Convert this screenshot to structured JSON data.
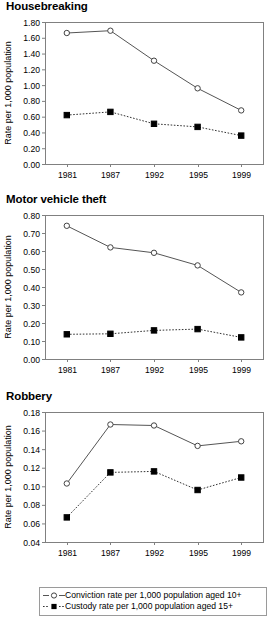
{
  "figure": {
    "y_axis_title": "Rate per 1,000 population",
    "x_categories": [
      "1981",
      "1987",
      "1992",
      "1995",
      "1999"
    ]
  },
  "legend": {
    "items": [
      {
        "label": "Conviction rate per 1,000 population aged 10+",
        "marker": "open-circle-marker",
        "line": "solid"
      },
      {
        "label": "Custody rate per 1,000 population aged 15+",
        "marker": "filled-square-marker",
        "line": "dotted"
      }
    ]
  },
  "chart_data": [
    {
      "type": "line",
      "title": "Housebreaking",
      "xlabel": "",
      "ylabel": "Rate per 1,000 population",
      "categories": [
        "1981",
        "1987",
        "1992",
        "1995",
        "1999"
      ],
      "ylim": [
        0.0,
        1.8
      ],
      "yticks": [
        "0.00",
        "0.20",
        "0.40",
        "0.60",
        "0.80",
        "1.00",
        "1.20",
        "1.40",
        "1.60",
        "1.80"
      ],
      "ytick_values": [
        0.0,
        0.2,
        0.4,
        0.6,
        0.8,
        1.0,
        1.2,
        1.4,
        1.6,
        1.8
      ],
      "grid": false,
      "legend_position": "below-figure",
      "series": [
        {
          "name": "Conviction rate per 1,000 population aged 10+",
          "style": "solid",
          "marker": "open-circle",
          "values": [
            1.66,
            1.69,
            1.31,
            0.96,
            0.68
          ]
        },
        {
          "name": "Custody rate per 1,000 population aged 15+",
          "style": "dotted",
          "marker": "filled-square",
          "values": [
            0.62,
            0.66,
            0.51,
            0.47,
            0.36
          ]
        }
      ]
    },
    {
      "type": "line",
      "title": "Motor vehicle theft",
      "xlabel": "",
      "ylabel": "Rate per 1,000 population",
      "categories": [
        "1981",
        "1987",
        "1992",
        "1995",
        "1999"
      ],
      "ylim": [
        0.0,
        0.8
      ],
      "yticks": [
        "0.00",
        "0.10",
        "0.20",
        "0.30",
        "0.40",
        "0.50",
        "0.60",
        "0.70",
        "0.80"
      ],
      "ytick_values": [
        0.0,
        0.1,
        0.2,
        0.3,
        0.4,
        0.5,
        0.6,
        0.7,
        0.8
      ],
      "grid": false,
      "legend_position": "below-figure",
      "series": [
        {
          "name": "Conviction rate per 1,000 population aged 10+",
          "style": "solid",
          "marker": "open-circle",
          "values": [
            0.74,
            0.62,
            0.59,
            0.52,
            0.37
          ]
        },
        {
          "name": "Custody rate per 1,000 population aged 15+",
          "style": "dotted",
          "marker": "filled-square",
          "values": [
            0.137,
            0.14,
            0.159,
            0.166,
            0.12
          ]
        }
      ]
    },
    {
      "type": "line",
      "title": "Robbery",
      "xlabel": "",
      "ylabel": "Rate per 1,000 population",
      "categories": [
        "1981",
        "1987",
        "1992",
        "1995",
        "1999"
      ],
      "ylim": [
        0.04,
        0.18
      ],
      "yticks": [
        "0.04",
        "0.06",
        "0.08",
        "0.10",
        "0.12",
        "0.14",
        "0.16",
        "0.18"
      ],
      "ytick_values": [
        0.04,
        0.06,
        0.08,
        0.1,
        0.12,
        0.14,
        0.16,
        0.18
      ],
      "grid": false,
      "legend_position": "below-figure",
      "series": [
        {
          "name": "Conviction rate per 1,000 population aged 10+",
          "style": "solid",
          "marker": "open-circle",
          "values": [
            0.103,
            0.1665,
            0.1655,
            0.1435,
            0.1485
          ]
        },
        {
          "name": "Custody rate per 1,000 population aged 15+",
          "style": "dotted",
          "marker": "filled-square",
          "values": [
            0.0665,
            0.115,
            0.116,
            0.096,
            0.1095
          ]
        }
      ]
    }
  ],
  "colors": {
    "frame": "#808080",
    "solid_series": "#555555",
    "dotted_series": "#333333",
    "marker_fill_open": "#ffffff",
    "marker_fill_closed": "#000000",
    "background": "#ffffff"
  }
}
